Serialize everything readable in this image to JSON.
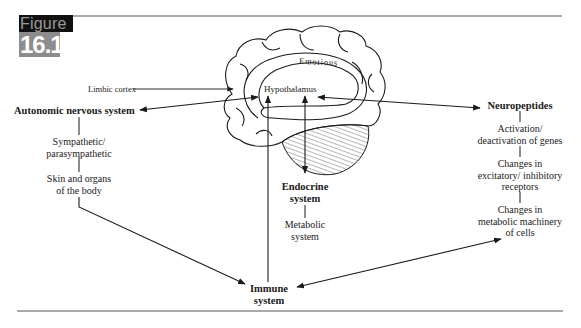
{
  "figure": {
    "word": "Figure",
    "number": "16.1"
  },
  "brain": {
    "label_limbic": "Limbic cortex",
    "label_emotions": "Emotions",
    "label_hypothalamus": "Hypothalamus"
  },
  "left_branch": {
    "title": "Autonomic nervous system",
    "items": [
      "Sympathetic/",
      "parasympathetic",
      "Skin and organs",
      "of the body"
    ]
  },
  "center_branch": {
    "title_line1": "Endocrine",
    "title_line2": "system",
    "item_line1": "Metabolic",
    "item_line2": "system"
  },
  "right_branch": {
    "title": "Neuropeptides",
    "items": [
      [
        "Activation/",
        "deactivation of genes"
      ],
      [
        "Changes in",
        "excitatory/ inhibitory",
        "receptors"
      ],
      [
        "Changes in",
        "metabolic machinery",
        "of cells"
      ]
    ]
  },
  "bottom_node": {
    "line1": "Immune",
    "line2": "system"
  },
  "colors": {
    "ink": "#1a1a1a",
    "badge_dark": "#111111",
    "badge_gray": "#8c8c8c",
    "rule": "#555555"
  }
}
